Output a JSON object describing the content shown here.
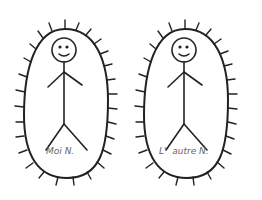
{
  "figures": [
    {
      "label": "Moi N."
    },
    {
      "label": "L'  autre N."
    }
  ],
  "colors": {
    "stroke": "#222222",
    "label": "#666666",
    "background": "#ffffff"
  }
}
